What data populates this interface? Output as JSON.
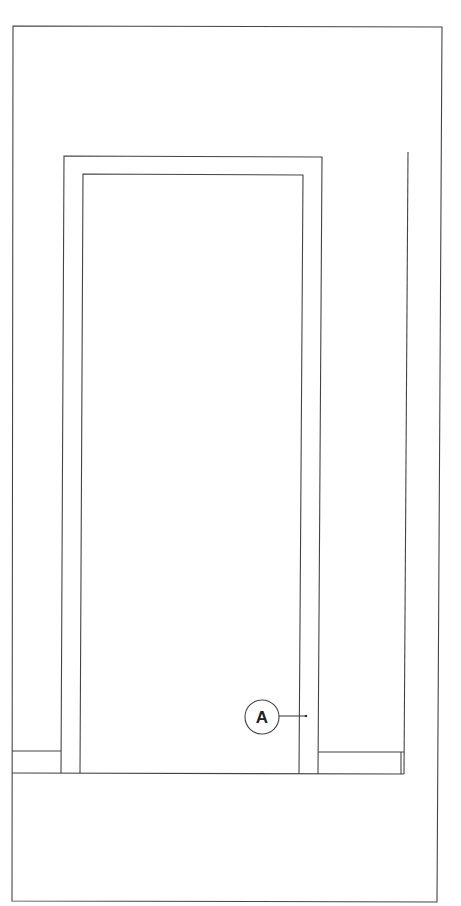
{
  "diagram": {
    "type": "door-elevation",
    "callouts": [
      {
        "label": "A",
        "target": "door-frame-jamb"
      }
    ],
    "colors": {
      "line": "#444444",
      "background": "#ffffff"
    }
  }
}
